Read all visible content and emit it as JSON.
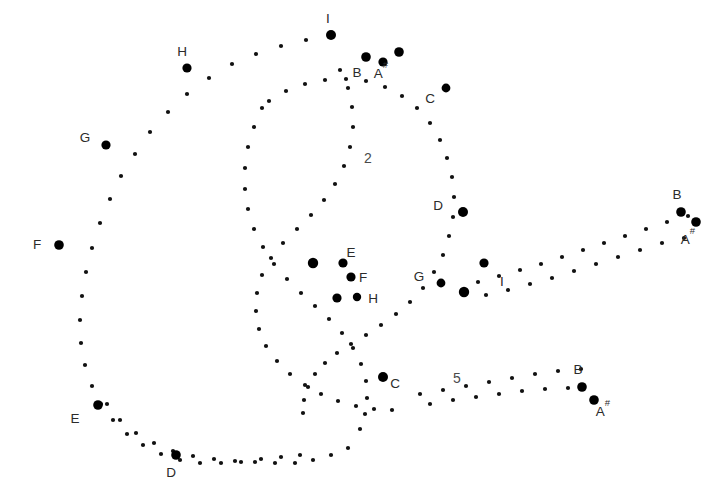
{
  "figure": {
    "background_color": "#ffffff",
    "dot_color": "#111111",
    "emphasis_dot_color": "#000000",
    "label_color": "#2b2b2b",
    "region_label_color": "#4a4a4a",
    "width": 719,
    "height": 497
  },
  "chart_data": {
    "type": "scatter",
    "xlabel": "",
    "ylabel": "",
    "xlim": [
      0,
      719
    ],
    "ylim": [
      0,
      497
    ],
    "grid": false,
    "legend": "none",
    "series": [
      {
        "name": "outer-arc-upper",
        "marker": "dot",
        "points": [
          [
            331,
            35
          ],
          [
            306,
            40
          ],
          [
            281,
            46
          ],
          [
            256,
            54
          ],
          [
            232,
            64
          ],
          [
            209,
            78
          ],
          [
            187,
            94
          ],
          [
            168,
            112
          ],
          [
            150,
            132
          ],
          [
            135,
            154
          ],
          [
            121,
            176
          ],
          [
            110,
            199
          ],
          [
            100,
            223
          ],
          [
            92,
            248
          ],
          [
            86,
            272
          ],
          [
            82,
            296
          ],
          [
            80,
            320
          ],
          [
            81,
            343
          ],
          [
            85,
            365
          ],
          [
            92,
            386
          ],
          [
            101,
            404
          ],
          [
            113,
            420
          ],
          [
            127,
            434
          ],
          [
            143,
            445
          ],
          [
            161,
            454
          ],
          [
            180,
            460
          ],
          [
            200,
            463
          ],
          [
            221,
            463
          ],
          [
            241,
            462
          ],
          [
            261,
            459
          ],
          [
            281,
            457
          ],
          [
            300,
            455
          ]
        ]
      },
      {
        "name": "outer-arc-lower",
        "marker": "dot",
        "points": [
          [
            107,
            404
          ],
          [
            120,
            420
          ],
          [
            136,
            433
          ],
          [
            154,
            443
          ],
          [
            173,
            451
          ],
          [
            193,
            456
          ],
          [
            214,
            459
          ],
          [
            235,
            461
          ],
          [
            255,
            462
          ],
          [
            275,
            463
          ],
          [
            295,
            463
          ],
          [
            313,
            460
          ],
          [
            331,
            455
          ],
          [
            348,
            448
          ]
        ]
      },
      {
        "name": "inner-arc",
        "marker": "dot",
        "points": [
          [
            269,
            101
          ],
          [
            286,
            91
          ],
          [
            305,
            84
          ],
          [
            325,
            80
          ],
          [
            346,
            79
          ],
          [
            366,
            81
          ],
          [
            385,
            87
          ],
          [
            402,
            96
          ],
          [
            417,
            108
          ],
          [
            430,
            123
          ],
          [
            440,
            140
          ],
          [
            447,
            158
          ],
          [
            452,
            177
          ],
          [
            454,
            197
          ],
          [
            453,
            217
          ],
          [
            449,
            236
          ],
          [
            443,
            255
          ],
          [
            434,
            272
          ],
          [
            423,
            288
          ],
          [
            410,
            302
          ],
          [
            396,
            314
          ],
          [
            381,
            325
          ],
          [
            366,
            335
          ],
          [
            351,
            344
          ],
          [
            337,
            353
          ],
          [
            325,
            363
          ],
          [
            315,
            374
          ],
          [
            308,
            387
          ],
          [
            304,
            400
          ],
          [
            303,
            413
          ]
        ]
      },
      {
        "name": "inner-arc-2",
        "marker": "dot",
        "points": [
          [
            262,
            108
          ],
          [
            254,
            127
          ],
          [
            248,
            147
          ],
          [
            245,
            168
          ],
          [
            245,
            189
          ],
          [
            248,
            209
          ],
          [
            254,
            229
          ],
          [
            263,
            247
          ],
          [
            274,
            264
          ],
          [
            287,
            279
          ],
          [
            301,
            293
          ],
          [
            315,
            306
          ],
          [
            329,
            319
          ],
          [
            342,
            333
          ],
          [
            353,
            348
          ],
          [
            361,
            364
          ],
          [
            366,
            381
          ],
          [
            367,
            398
          ],
          [
            365,
            414
          ],
          [
            360,
            429
          ]
        ]
      },
      {
        "name": "mid-arc",
        "marker": "dot",
        "points": [
          [
            340,
            70
          ],
          [
            348,
            88
          ],
          [
            352,
            107
          ],
          [
            353,
            127
          ],
          [
            350,
            147
          ],
          [
            344,
            166
          ],
          [
            335,
            184
          ],
          [
            324,
            200
          ],
          [
            311,
            215
          ],
          [
            297,
            229
          ],
          [
            283,
            243
          ],
          [
            271,
            258
          ],
          [
            262,
            275
          ],
          [
            257,
            293
          ],
          [
            256,
            311
          ],
          [
            259,
            329
          ],
          [
            266,
            346
          ],
          [
            277,
            361
          ],
          [
            290,
            374
          ],
          [
            305,
            385
          ],
          [
            321,
            394
          ],
          [
            338,
            401
          ],
          [
            356,
            406
          ],
          [
            374,
            409
          ],
          [
            392,
            410
          ]
        ]
      },
      {
        "name": "branch-upper-right",
        "marker": "dot",
        "points": [
          [
            478,
            282
          ],
          [
            499,
            276
          ],
          [
            520,
            270
          ],
          [
            541,
            264
          ],
          [
            562,
            257
          ],
          [
            583,
            250
          ],
          [
            604,
            243
          ],
          [
            625,
            236
          ],
          [
            646,
            229
          ],
          [
            667,
            222
          ],
          [
            688,
            216
          ]
        ]
      },
      {
        "name": "branch-upper-right-2",
        "marker": "dot",
        "points": [
          [
            486,
            295
          ],
          [
            508,
            290
          ],
          [
            530,
            284
          ],
          [
            552,
            278
          ],
          [
            574,
            271
          ],
          [
            596,
            264
          ],
          [
            618,
            257
          ],
          [
            640,
            250
          ],
          [
            662,
            243
          ],
          [
            684,
            238
          ]
        ]
      },
      {
        "name": "branch-lower-right",
        "marker": "dot",
        "points": [
          [
            420,
            394
          ],
          [
            443,
            390
          ],
          [
            466,
            386
          ],
          [
            489,
            382
          ],
          [
            512,
            378
          ],
          [
            535,
            374
          ],
          [
            558,
            371
          ],
          [
            581,
            369
          ]
        ]
      },
      {
        "name": "branch-lower-right-2",
        "marker": "dot",
        "points": [
          [
            430,
            404
          ],
          [
            453,
            400
          ],
          [
            476,
            397
          ],
          [
            499,
            394
          ],
          [
            522,
            391
          ],
          [
            545,
            389
          ],
          [
            568,
            388
          ]
        ]
      }
    ],
    "emphasized_points": [
      {
        "id": "p-I-top",
        "label": "I",
        "x": 331,
        "y": 35,
        "r": 5.0,
        "label_dx": -3,
        "label_dy": -12
      },
      {
        "id": "p-H-outer",
        "label": "H",
        "x": 187,
        "y": 68,
        "r": 4.6,
        "label_dx": -5,
        "label_dy": -12
      },
      {
        "id": "p-G-outer",
        "label": "G",
        "x": 106,
        "y": 145,
        "r": 4.6,
        "label_dx": -21,
        "label_dy": -3
      },
      {
        "id": "p-F-outer",
        "label": "F",
        "x": 59,
        "y": 245,
        "r": 4.8,
        "label_dx": -22,
        "label_dy": 4
      },
      {
        "id": "p-E-outer",
        "label": "E",
        "x": 98,
        "y": 405,
        "r": 4.8,
        "label_dx": -23,
        "label_dy": 18
      },
      {
        "id": "p-D-outer",
        "label": "D",
        "x": 176,
        "y": 455,
        "r": 4.8,
        "label_dx": -5,
        "label_dy": 22
      },
      {
        "id": "p-B-top",
        "label": "B",
        "x": 366,
        "y": 57,
        "r": 4.8,
        "label_dx": -9,
        "label_dy": 20
      },
      {
        "id": "p-Bsharp-top",
        "label": "A#",
        "x": 383,
        "y": 62,
        "r": 4.6,
        "label_dx": -2,
        "label_dy": 16
      },
      {
        "id": "p-A-top-right",
        "label": "",
        "x": 399,
        "y": 52,
        "r": 4.8,
        "label_dx": 0,
        "label_dy": 0
      },
      {
        "id": "p-C-upper",
        "label": "C",
        "x": 446,
        "y": 88,
        "r": 4.4,
        "label_dx": -16,
        "label_dy": 15
      },
      {
        "id": "p-D-mid",
        "label": "D",
        "x": 463,
        "y": 212,
        "r": 5.0,
        "label_dx": -25,
        "label_dy": -2
      },
      {
        "id": "p-E-mid",
        "label": "E",
        "x": 313,
        "y": 263,
        "r": 5.2,
        "label_dx": 38,
        "label_dy": -6
      },
      {
        "id": "p-E-mid-b",
        "label": "",
        "x": 343,
        "y": 263,
        "r": 4.6,
        "label_dx": 0,
        "label_dy": 0
      },
      {
        "id": "p-F-mid",
        "label": "F",
        "x": 351,
        "y": 277,
        "r": 4.6,
        "label_dx": 12,
        "label_dy": 5
      },
      {
        "id": "p-H-mid",
        "label": "H",
        "x": 337,
        "y": 298,
        "r": 4.6,
        "label_dx": 36,
        "label_dy": 5
      },
      {
        "id": "p-H-mid-b",
        "label": "",
        "x": 357,
        "y": 297,
        "r": 4.2,
        "label_dx": 0,
        "label_dy": 0
      },
      {
        "id": "p-G-mid",
        "label": "G",
        "x": 441,
        "y": 283,
        "r": 4.4,
        "label_dx": -22,
        "label_dy": -2
      },
      {
        "id": "p-I-mid",
        "label": "I",
        "x": 464,
        "y": 292,
        "r": 5.2,
        "label_dx": 38,
        "label_dy": -6
      },
      {
        "id": "p-I-mid-b",
        "label": "",
        "x": 484,
        "y": 263,
        "r": 4.6,
        "label_dx": 0,
        "label_dy": 0
      },
      {
        "id": "p-C-lower",
        "label": "C",
        "x": 383,
        "y": 377,
        "r": 5.0,
        "label_dx": 12,
        "label_dy": 11
      },
      {
        "id": "p-B-right",
        "label": "B",
        "x": 681,
        "y": 212,
        "r": 4.8,
        "label_dx": -4,
        "label_dy": -13
      },
      {
        "id": "p-Asharp-right",
        "label": "A#",
        "x": 696,
        "y": 222,
        "r": 4.8,
        "label_dx": -8,
        "label_dy": 22
      },
      {
        "id": "p-B-lowright",
        "label": "B",
        "x": 582,
        "y": 387,
        "r": 4.8,
        "label_dx": -4,
        "label_dy": -13
      },
      {
        "id": "p-Asharp-lowr",
        "label": "A#",
        "x": 594,
        "y": 400,
        "r": 4.8,
        "label_dx": 9,
        "label_dy": 16
      }
    ],
    "region_labels": [
      {
        "id": "region-2",
        "text": "2",
        "x": 368,
        "y": 163
      },
      {
        "id": "region-5",
        "text": "5",
        "x": 457,
        "y": 383
      }
    ]
  }
}
